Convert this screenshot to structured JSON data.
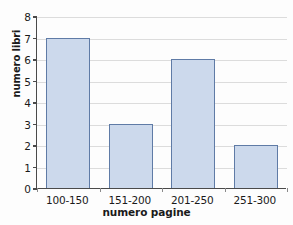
{
  "chart_data": {
    "type": "bar",
    "title": "",
    "xlabel": "numero pagine",
    "ylabel": "numero libri",
    "categories": [
      "100-150",
      "151-200",
      "201-250",
      "251-300"
    ],
    "values": [
      7,
      3,
      6,
      2
    ],
    "ylim": [
      0,
      8
    ],
    "ytick_labels": [
      "0",
      "1",
      "2",
      "3",
      "4",
      "5",
      "6",
      "7",
      "8"
    ],
    "ytick_values": [
      0,
      1,
      2,
      3,
      4,
      5,
      6,
      7,
      8
    ],
    "grid": "horizontal",
    "legend": "none",
    "colors": {
      "bar_fill": "#ccd9ec",
      "bar_edge": "#5f7ba6",
      "gridline": "#dcdcdc",
      "axis": "#4a4a4a",
      "background": "#fdfdfd",
      "text": "#1a1a1a"
    }
  }
}
